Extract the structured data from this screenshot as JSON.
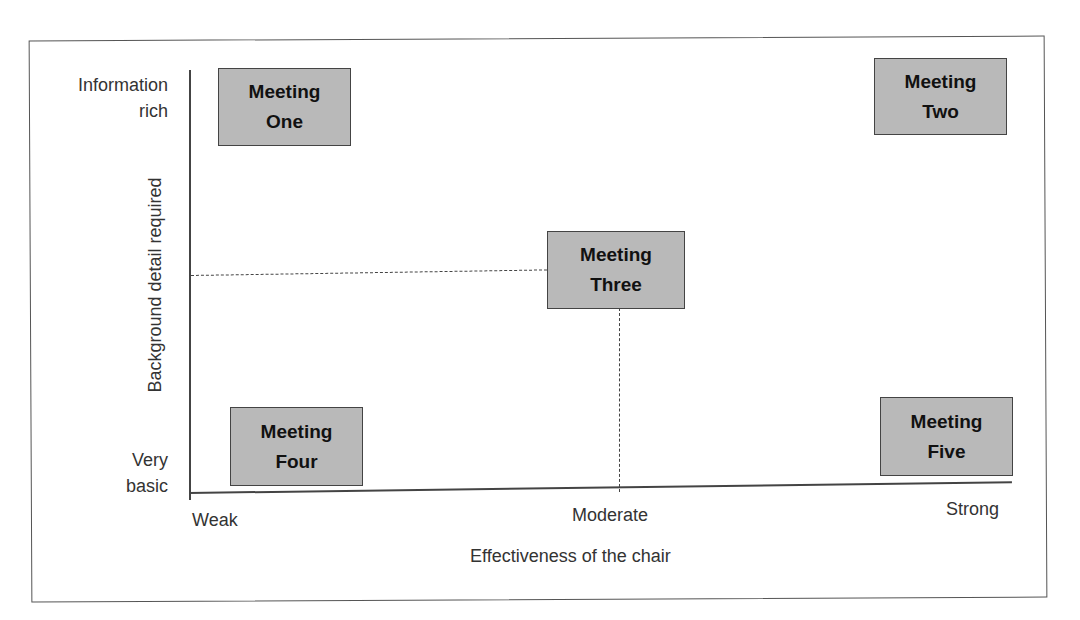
{
  "diagram": {
    "type": "2x2-positioning-matrix",
    "y_axis": {
      "title": "Background detail required",
      "high_label": [
        "Information",
        "rich"
      ],
      "low_label": [
        "Very",
        "basic"
      ]
    },
    "x_axis": {
      "title": "Effectiveness of the chair",
      "ticks": [
        "Weak",
        "Moderate",
        "Strong"
      ]
    },
    "items": [
      {
        "line1": "Meeting",
        "line2": "One",
        "x": "Weak",
        "y": "Information rich"
      },
      {
        "line1": "Meeting",
        "line2": "Two",
        "x": "Strong",
        "y": "Information rich"
      },
      {
        "line1": "Meeting",
        "line2": "Three",
        "x": "Moderate",
        "y": "Moderate"
      },
      {
        "line1": "Meeting",
        "line2": "Four",
        "x": "Weak",
        "y": "Very basic"
      },
      {
        "line1": "Meeting",
        "line2": "Five",
        "x": "Strong",
        "y": "Very basic"
      }
    ],
    "colors": {
      "box_fill": "#b9b9b9",
      "box_border": "#444444",
      "lines": "#444444"
    }
  }
}
